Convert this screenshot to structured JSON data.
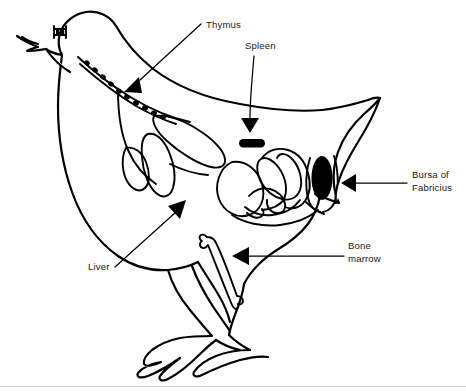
{
  "figure": {
    "type": "anatomical-diagram",
    "style": "black and white line drawing",
    "background_color": "#ffffff",
    "line_color": "#000000",
    "text_color": "#1a1a1a",
    "width": 466,
    "height": 391
  },
  "labels": [
    {
      "id": "thymus",
      "text": "Thymus",
      "lines": [
        "Thymus"
      ],
      "text_x": 206,
      "text_y": 28,
      "anchor": "start",
      "leader_from": [
        201,
        24
      ],
      "leader_to": [
        135,
        84
      ],
      "arrow_at": [
        128,
        90
      ],
      "arrow_angle": 137,
      "organ_render": "dotted-chain-along-neck",
      "organ_color": "#000000"
    },
    {
      "id": "spleen",
      "text": "Spleen",
      "lines": [
        "Spleen"
      ],
      "text_x": 245,
      "text_y": 49,
      "anchor": "start",
      "leader_from": [
        252,
        55
      ],
      "leader_to": [
        252,
        122
      ],
      "arrow_at": [
        252,
        130
      ],
      "arrow_angle": 90,
      "organ_render": "small-black-pill",
      "organ_color": "#000000"
    },
    {
      "id": "bursa-of-fabricius",
      "text": "Bursa of Fabricius",
      "lines": [
        "Bursa of",
        "Fabricius"
      ],
      "text_x": 412,
      "text_y": 178,
      "anchor": "start",
      "leader_from": [
        407,
        183
      ],
      "leader_to": [
        352,
        183
      ],
      "arrow_at": [
        344,
        183
      ],
      "arrow_angle": 180,
      "organ_render": "vertical-black-oval",
      "organ_color": "#000000"
    },
    {
      "id": "bone-marrow",
      "text": "Bone marrow",
      "lines": [
        "Bone",
        "marrow"
      ],
      "text_x": 348,
      "text_y": 249,
      "anchor": "start",
      "leader_from": [
        344,
        256
      ],
      "leader_to": [
        240,
        256
      ],
      "arrow_at": [
        232,
        256
      ],
      "arrow_angle": 180,
      "organ_render": "femur-bone-outline",
      "organ_color": "#ffffff"
    },
    {
      "id": "liver",
      "text": "Liver",
      "lines": [
        "Liver"
      ],
      "text_x": 88,
      "text_y": 270,
      "anchor": "start",
      "leader_from": [
        115,
        267
      ],
      "leader_to": [
        178,
        208
      ],
      "arrow_at": [
        185,
        201
      ],
      "arrow_angle": 316,
      "organ_render": "lobed-organ-outline",
      "organ_color": "#ffffff"
    }
  ],
  "anatomy_parts": [
    {
      "id": "body-outline",
      "name": "chicken-body-outline"
    },
    {
      "id": "head",
      "name": "chicken-head"
    },
    {
      "id": "beak",
      "name": "chicken-beak"
    },
    {
      "id": "eye",
      "name": "chicken-eye"
    },
    {
      "id": "neck",
      "name": "chicken-neck"
    },
    {
      "id": "tail",
      "name": "chicken-tail"
    },
    {
      "id": "legs",
      "name": "chicken-legs-and-feet"
    },
    {
      "id": "thymus-chain",
      "name": "thymus-lobe-chain"
    },
    {
      "id": "esophagus",
      "name": "esophagus-line"
    },
    {
      "id": "liver-lobes",
      "name": "liver-lobes"
    },
    {
      "id": "proventriculus",
      "name": "proventriculus"
    },
    {
      "id": "gizzard",
      "name": "gizzard"
    },
    {
      "id": "intestines",
      "name": "coiled-intestines"
    },
    {
      "id": "spleen-organ",
      "name": "spleen"
    },
    {
      "id": "bursa-organ",
      "name": "bursa-of-fabricius"
    },
    {
      "id": "femur",
      "name": "femur-bone-marrow"
    }
  ]
}
